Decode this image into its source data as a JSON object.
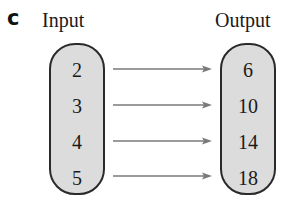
{
  "panel_label": "c",
  "input": {
    "title": "Input",
    "values": [
      "2",
      "3",
      "4",
      "5"
    ]
  },
  "output": {
    "title": "Output",
    "values": [
      "6",
      "10",
      "14",
      "18"
    ]
  },
  "mappings": [
    {
      "from": "2",
      "to": "6"
    },
    {
      "from": "3",
      "to": "10"
    },
    {
      "from": "4",
      "to": "14"
    },
    {
      "from": "5",
      "to": "18"
    }
  ],
  "colors": {
    "box_fill": "#dcdcdc",
    "box_border": "#2a2a2a",
    "arrow": "#7a7a7a"
  }
}
